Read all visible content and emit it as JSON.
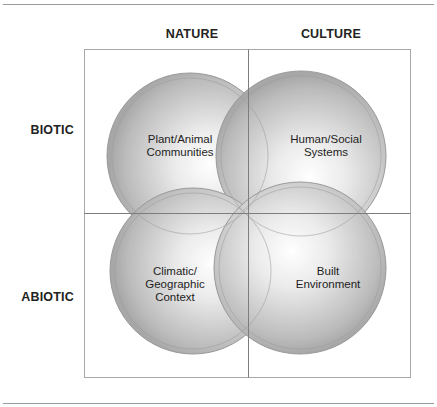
{
  "diagram": {
    "columns": [
      {
        "id": "nature",
        "label": "NATURE"
      },
      {
        "id": "culture",
        "label": "CULTURE"
      }
    ],
    "rows": [
      {
        "id": "biotic",
        "label": "BIOTIC"
      },
      {
        "id": "abiotic",
        "label": "ABIOTIC"
      }
    ],
    "circles": [
      {
        "id": "plant-animal",
        "label": "Plant/Animal\nCommunities",
        "quadrant": "nature-biotic"
      },
      {
        "id": "human-social",
        "label": "Human/Social\nSystems",
        "quadrant": "culture-biotic"
      },
      {
        "id": "climatic-geographic",
        "label": "Climatic/\nGeographic\nContext",
        "quadrant": "nature-abiotic"
      },
      {
        "id": "built-environment",
        "label": "Built\nEnvironment",
        "quadrant": "culture-abiotic"
      }
    ],
    "colors": {
      "circle_edge": "#8c8c8c",
      "circle_center": "#ffffff",
      "grid_line": "#8a8a8a",
      "text": "#1e1e1e"
    }
  }
}
